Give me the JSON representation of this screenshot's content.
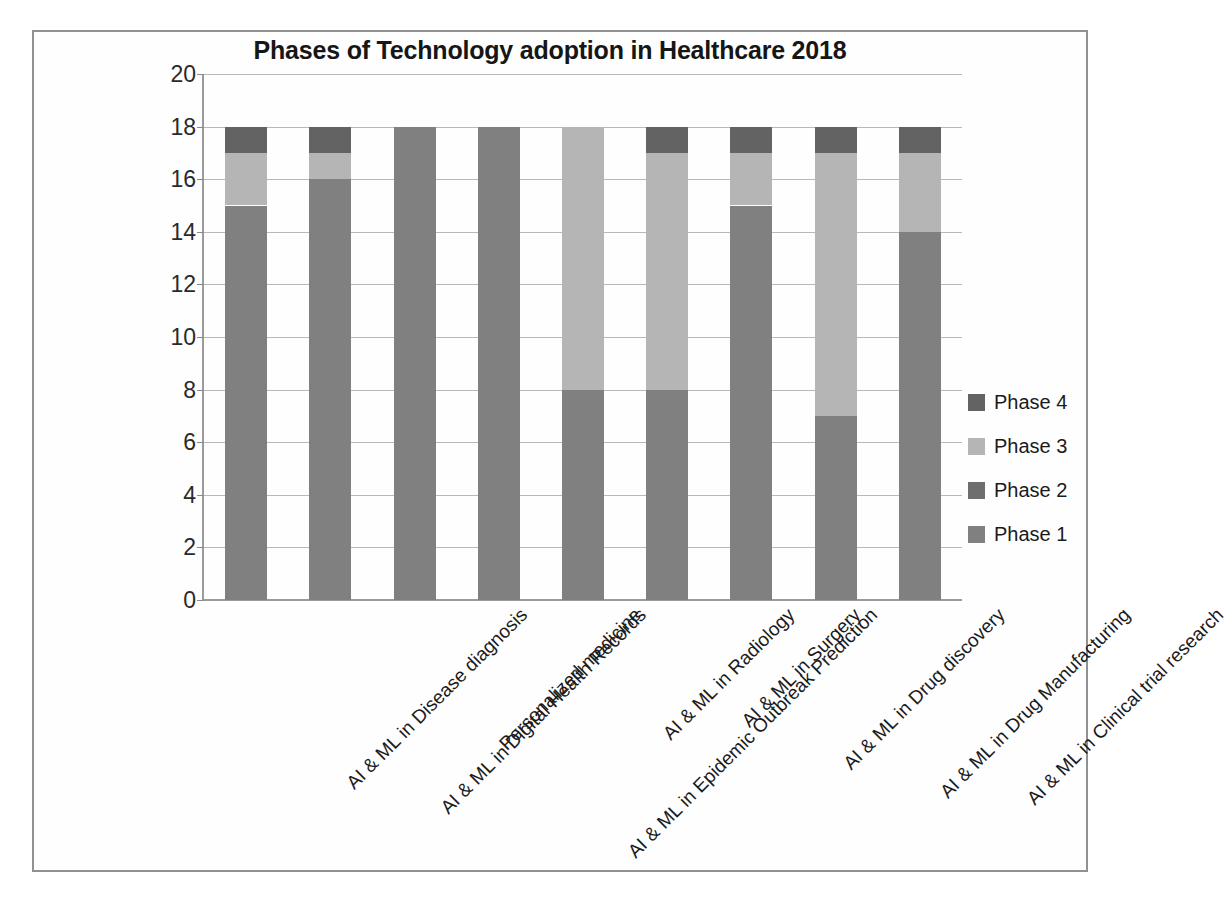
{
  "chart_data": {
    "type": "bar",
    "subtype": "stacked-column",
    "title": "Phases of Technology adoption in Healthcare 2018",
    "xlabel": "",
    "ylabel": "",
    "ylim": [
      0,
      20
    ],
    "ytick_step": 2,
    "ytick_labels": [
      "20",
      "18",
      "16",
      "14",
      "12",
      "10",
      "8",
      "6",
      "4",
      "2",
      "0"
    ],
    "grid": true,
    "legend_position": "right",
    "categories": [
      "AI & ML in Disease diagnosis",
      "AI & ML in Digital Health Records",
      "Personalized medicine",
      "AI & ML in Epidemic Outbreak Prediction",
      "AI & ML in Radiology",
      "AI & ML in Surgery",
      "AI & ML in Drug discovery",
      "AI & ML in Drug Manufacturing",
      "AI & ML in Clinical trial research"
    ],
    "series": [
      {
        "name": "Phase 1",
        "color": "#808080",
        "values": [
          15,
          16,
          18,
          18,
          8,
          8,
          15,
          7,
          14
        ]
      },
      {
        "name": "Phase 2",
        "color": "#6e6e6e",
        "values": [
          0,
          0,
          0,
          0,
          0,
          0,
          0,
          0,
          0
        ]
      },
      {
        "name": "Phase 3",
        "color": "#b5b5b5",
        "values": [
          2,
          1,
          0,
          0,
          10,
          9,
          2,
          10,
          3
        ]
      },
      {
        "name": "Phase 4",
        "color": "#636363",
        "values": [
          1,
          1,
          0,
          0,
          0,
          1,
          1,
          1,
          1
        ]
      }
    ],
    "totals": [
      18,
      18,
      18,
      18,
      18,
      18,
      18,
      18,
      18
    ]
  },
  "legend": {
    "items": [
      {
        "label": "Phase 4",
        "color": "#636363"
      },
      {
        "label": "Phase 3",
        "color": "#b5b5b5"
      },
      {
        "label": "Phase 2",
        "color": "#6e6e6e"
      },
      {
        "label": "Phase 1",
        "color": "#808080"
      }
    ]
  },
  "colors": {
    "phase1": "#808080",
    "phase2": "#6e6e6e",
    "phase3": "#b5b5b5",
    "phase4": "#636363",
    "gridline": "#b9b9b9",
    "axis": "#9a9a9a",
    "frame": "#8e9196",
    "text": "#1b1b1b"
  }
}
